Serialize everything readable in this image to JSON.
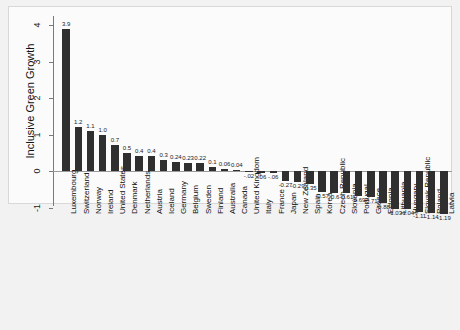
{
  "chart_data": {
    "type": "bar",
    "title": "",
    "subtitle": "",
    "xlabel": "",
    "ylabel": "Inclusive Green Growth",
    "ylim": [
      -1.45,
      4.35
    ],
    "yticks": [
      -1,
      0,
      1,
      2,
      3,
      4
    ],
    "ytick_labels": [
      "-1",
      "0",
      "1",
      "2",
      "3",
      "4"
    ],
    "grid": false,
    "legend": null,
    "legend_position": "none",
    "bar_color": "#2f2f2f",
    "background_color": "#f2f2f2",
    "plot_background_color": "#fbfbfb",
    "axis_color": "#7a7a7a",
    "categories": [
      "Luxembourg",
      "Switzerland",
      "Norway",
      "Ireland",
      "United States",
      "Denmark",
      "Netherlands",
      "Austria",
      "Iceland",
      "Germany",
      "Belgium",
      "Sweden",
      "Finland",
      "Australia",
      "Canada",
      "United Kingdom",
      "Italy",
      "France",
      "Japan",
      "New Zealand",
      "Spain",
      "Korea",
      "Czech Republic",
      "Slovenia",
      "Portugal",
      "Greece",
      "Estonia",
      "Lithuania",
      "Hungary",
      "Slovak Republic",
      "Poland",
      "Latvia"
    ],
    "values": [
      3.9,
      1.2,
      1.1,
      1.0,
      0.7,
      0.5,
      0.4,
      0.4,
      0.3,
      0.24,
      0.23,
      0.22,
      0.1,
      0.06,
      0.04,
      -0.02,
      -0.06,
      -0.06,
      -0.27,
      -0.29,
      -0.35,
      -0.57,
      -0.6,
      -0.61,
      -0.69,
      -0.71,
      -0.88,
      -1.03,
      -1.04,
      -1.11,
      -1.14,
      -1.19
    ],
    "value_labels": [
      "3.9",
      "1.2",
      "1.1",
      "1.0",
      "0.7",
      "0.5",
      "0.4",
      "0.4",
      "0.3",
      "0.24",
      "0.23",
      "0.22",
      "0.1",
      "0.06",
      "0.04",
      "-.02",
      "-.06",
      "-.06",
      "-0.27",
      "-0.29",
      "-0.35",
      "-0.57",
      "-0.6",
      "-0.61",
      "-0.69",
      "-0.71",
      "-0.88",
      "-1.03",
      "-1.04",
      "-1.11",
      "-1.14",
      "-1.19"
    ]
  }
}
